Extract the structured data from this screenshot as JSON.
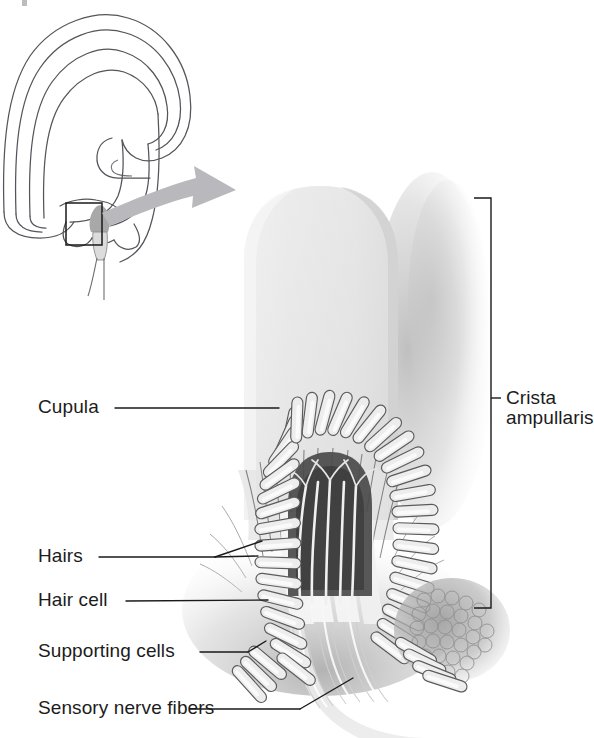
{
  "figure": {
    "type": "anatomical-illustration",
    "background_color": "#ffffff",
    "ink_color": "#1a1a1a"
  },
  "inset": {
    "name": "semicircular canal schematic",
    "highlight_box": "ampulla region",
    "arrow": "magnification arrow",
    "line_color": "#54545a",
    "arrow_color": "#b9b9bd"
  },
  "labels": {
    "left": [
      {
        "id": "cupula",
        "text": "Cupula"
      },
      {
        "id": "hairs",
        "text": "Hairs"
      },
      {
        "id": "hair_cell",
        "text": "Hair cell"
      },
      {
        "id": "supporting_cells",
        "text": "Supporting cells"
      },
      {
        "id": "sensory_nerve",
        "text": "Sensory nerve fibers"
      }
    ],
    "right": [
      {
        "id": "crista_ampullaris",
        "line1": "Crista",
        "line2": "ampullaris"
      }
    ]
  },
  "structures": {
    "cupula": {
      "name": "Cupula",
      "fill": "#e6e6e6",
      "shadow": "#c9c9c9"
    },
    "crista": {
      "name": "Crista ampullaris",
      "cell_fill": "#ededed",
      "cell_stroke": "#5d5d5d"
    },
    "nerve_fibers": {
      "name": "Sensory nerve fibers",
      "fill": "#e3e3e3"
    },
    "cell_cluster": {
      "name": "Supporting cell cluster texture",
      "fill": "#b8b8b8"
    }
  }
}
